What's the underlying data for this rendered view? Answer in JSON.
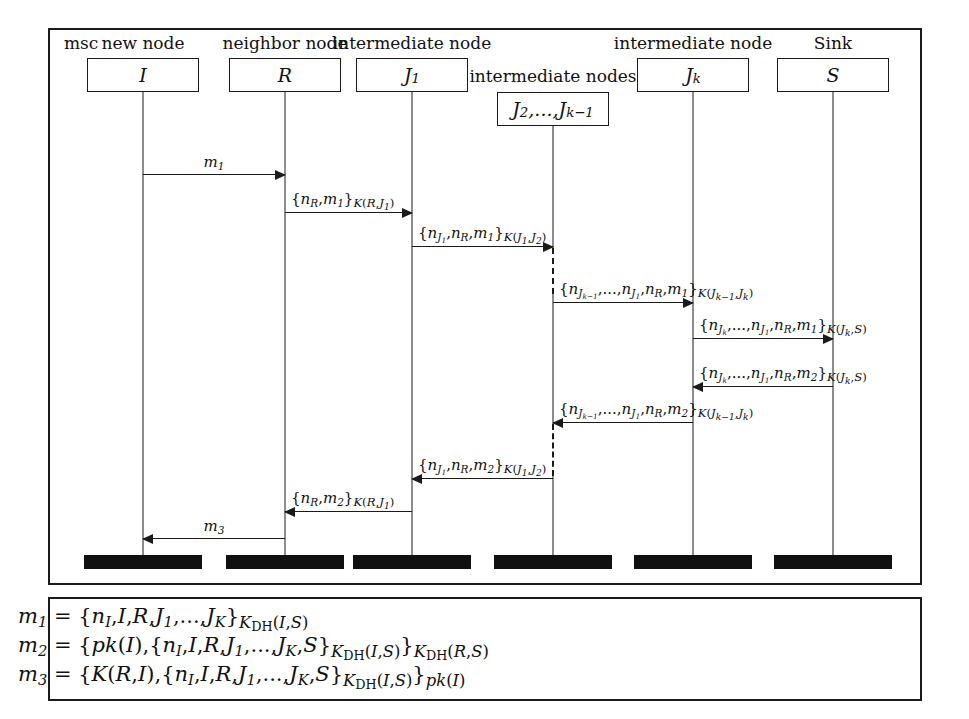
{
  "diagram": {
    "type": "message-sequence-chart",
    "keyword": "msc",
    "frame_label": "msc"
  },
  "instances": [
    {
      "role": "new node",
      "name": "I",
      "name_html": "<span class=\"mi\">I</span>",
      "x": 143,
      "box_w": 112
    },
    {
      "role": "neighbor node",
      "name": "R",
      "name_html": "<span class=\"mi\">R</span>",
      "x": 285,
      "box_w": 112
    },
    {
      "role": "intermediate node",
      "name": "J1",
      "name_html": "<span class=\"mi\">J</span><sub>1</sub>",
      "x": 412,
      "box_w": 112
    },
    {
      "role": "intermediate nodes",
      "name": "J2,...,Jk-1",
      "name_html": "<span class=\"mi\">J</span><sub>2</sub>,...,<span class=\"mi\">J</span><sub>k&minus;1</sub>",
      "x": 553,
      "box_w": 112
    },
    {
      "role": "intermediate node",
      "name": "Jk",
      "name_html": "<span class=\"mi\">J</span><sub>k</sub>",
      "x": 693,
      "box_w": 112
    },
    {
      "role": "Sink",
      "name": "S",
      "name_html": "<span class=\"mi\">S</span>",
      "x": 833,
      "box_w": 112
    }
  ],
  "messages": [
    {
      "id": "msg-1",
      "from": "I",
      "to": "R",
      "direction": "right",
      "label_plain": "m1",
      "label_html": "<span class=\"mi\">m</span><sub>1</sub>",
      "label_pos": "center",
      "y": 174,
      "x1": 143,
      "x2": 285
    },
    {
      "id": "msg-2",
      "from": "R",
      "to": "J1",
      "direction": "right",
      "label_plain": "{nR,m1}K(R,J1)",
      "label_html": "{<span class=\"mi\">n</span><sub>R</sub>,<span class=\"mi\">m</span><sub>1</sub>}<span class=\"sub-script\"><span class=\"mi\">K</span>(<span class=\"mi\">R</span>,<span class=\"mi\">J</span><sub>1</sub>)</span>",
      "label_pos": "left",
      "y": 212,
      "x1": 285,
      "x2": 412
    },
    {
      "id": "msg-3",
      "from": "J1",
      "to": "J2..Jk-1",
      "direction": "right",
      "label_plain": "{nJ1,nR,m1}K(J1,J2)",
      "label_html": "{<span class=\"mi\">n</span><sub><span class=\"mi\">J</span><sub>1</sub></sub>,<span class=\"mi\">n</span><sub>R</sub>,<span class=\"mi\">m</span><sub>1</sub>}<span class=\"sub-script\"><span class=\"mi\">K</span>(<span class=\"mi\">J</span><sub>1</sub>,<span class=\"mi\">J</span><sub>2</sub>)</span>",
      "label_pos": "left",
      "y": 246,
      "x1": 412,
      "x2": 553
    },
    {
      "id": "msg-4",
      "from": "J2..Jk-1",
      "to": "Jk",
      "direction": "right",
      "label_plain": "{nJk-1,...,nJ1,nR,m1}K(Jk-1,Jk)",
      "label_html": "{<span class=\"mi\">n</span><sub><span class=\"mi\">J</span><sub>k&minus;1</sub></sub>,...,<span class=\"mi\">n</span><sub><span class=\"mi\">J</span><sub>1</sub></sub>,<span class=\"mi\">n</span><sub>R</sub>,<span class=\"mi\">m</span><sub>1</sub>}<span class=\"sub-script\"><span class=\"mi\">K</span>(<span class=\"mi\">J</span><sub>k&minus;1</sub>,<span class=\"mi\">J</span><sub>k</sub>)</span>",
      "label_pos": "left",
      "y": 302,
      "x1": 553,
      "x2": 693
    },
    {
      "id": "msg-5",
      "from": "Jk",
      "to": "S",
      "direction": "right",
      "label_plain": "{nJk,...,nJ1,nR,m1}K(Jk,S)",
      "label_html": "{<span class=\"mi\">n</span><sub><span class=\"mi\">J</span><sub>k</sub></sub>,...,<span class=\"mi\">n</span><sub><span class=\"mi\">J</span><sub>1</sub></sub>,<span class=\"mi\">n</span><sub>R</sub>,<span class=\"mi\">m</span><sub>1</sub>}<span class=\"sub-script\"><span class=\"mi\">K</span>(<span class=\"mi\">J</span><sub>k</sub>,<span class=\"mi\">S</span>)</span>",
      "label_pos": "left",
      "y": 338,
      "x1": 693,
      "x2": 833
    },
    {
      "id": "msg-6",
      "from": "S",
      "to": "Jk",
      "direction": "left",
      "label_plain": "{nJk,...,nJ1,nR,m2}K(Jk,S)",
      "label_html": "{<span class=\"mi\">n</span><sub><span class=\"mi\">J</span><sub>k</sub></sub>,...,<span class=\"mi\">n</span><sub><span class=\"mi\">J</span><sub>1</sub></sub>,<span class=\"mi\">n</span><sub>R</sub>,<span class=\"mi\">m</span><sub>2</sub>}<span class=\"sub-script\"><span class=\"mi\">K</span>(<span class=\"mi\">J</span><sub>k</sub>,<span class=\"mi\">S</span>)</span>",
      "label_pos": "left",
      "y": 386,
      "x1": 693,
      "x2": 833
    },
    {
      "id": "msg-7",
      "from": "Jk",
      "to": "J2..Jk-1",
      "direction": "left",
      "label_plain": "{nJk-1,...,nJ1,nR,m2}K(Jk-1,Jk)",
      "label_html": "{<span class=\"mi\">n</span><sub><span class=\"mi\">J</span><sub>k&minus;1</sub></sub>,...,<span class=\"mi\">n</span><sub><span class=\"mi\">J</span><sub>1</sub></sub>,<span class=\"mi\">n</span><sub>R</sub>,<span class=\"mi\">m</span><sub>2</sub>}<span class=\"sub-script\"><span class=\"mi\">K</span>(<span class=\"mi\">J</span><sub>k&minus;1</sub>,<span class=\"mi\">J</span><sub>k</sub>)</span>",
      "label_pos": "left",
      "y": 422,
      "x1": 553,
      "x2": 693
    },
    {
      "id": "msg-8",
      "from": "J2..Jk-1",
      "to": "J1",
      "direction": "left",
      "label_plain": "{nJ1,nR,m2}K(J1,J2)",
      "label_html": "{<span class=\"mi\">n</span><sub><span class=\"mi\">J</span><sub>1</sub></sub>,<span class=\"mi\">n</span><sub>R</sub>,<span class=\"mi\">m</span><sub>2</sub>}<span class=\"sub-script\"><span class=\"mi\">K</span>(<span class=\"mi\">J</span><sub>1</sub>,<span class=\"mi\">J</span><sub>2</sub>)</span>",
      "label_pos": "left",
      "y": 478,
      "x1": 412,
      "x2": 553
    },
    {
      "id": "msg-9",
      "from": "J1",
      "to": "R",
      "direction": "left",
      "label_plain": "{nR,m2}K(R,J1)",
      "label_html": "{<span class=\"mi\">n</span><sub>R</sub>,<span class=\"mi\">m</span><sub>2</sub>}<span class=\"sub-script\"><span class=\"mi\">K</span>(<span class=\"mi\">R</span>,<span class=\"mi\">J</span><sub>1</sub>)</span>",
      "label_pos": "left",
      "y": 511,
      "x1": 285,
      "x2": 412
    },
    {
      "id": "msg-10",
      "from": "R",
      "to": "I",
      "direction": "left",
      "label_plain": "m3",
      "label_html": "<span class=\"mi\">m</span><sub>3</sub>",
      "label_pos": "center",
      "y": 538,
      "x1": 143,
      "x2": 285
    }
  ],
  "legend": [
    {
      "id": "def-m1",
      "plain": "m1 = {nI,I,R,J1,...,JK}KDH(I,S)",
      "html": "<span class=\"mi\">m</span><sub>1</sub> = {<span class=\"mi\">n</span><sub>I</sub>,<span class=\"mi\">I</span>,<span class=\"mi\">R</span>,<span class=\"mi\">J</span><sub>1</sub>,...,<span class=\"mi\">J</span><sub>K</sub>}<span class=\"sub-script\"><span class=\"mi\">K</span><sub><span class=\"mup\">DH</span></sub>(<span class=\"mi\">I</span>,<span class=\"mi\">S</span>)</span>"
    },
    {
      "id": "def-m2",
      "plain": "m2 = {pk(I),{nI,I,R,J1,...,JK,S}KDH(I,S)}KDH(R,S)",
      "html": "<span class=\"mi\">m</span><sub>2</sub> = {<span class=\"mi\">pk</span>(<span class=\"mi\">I</span>),{<span class=\"mi\">n</span><sub>I</sub>,<span class=\"mi\">I</span>,<span class=\"mi\">R</span>,<span class=\"mi\">J</span><sub>1</sub>,...,<span class=\"mi\">J</span><sub>K</sub>,<span class=\"mi\">S</span>}<span class=\"sub-script\"><span class=\"mi\">K</span><sub><span class=\"mup\">DH</span></sub>(<span class=\"mi\">I</span>,<span class=\"mi\">S</span>)</span>}<span class=\"sub-script\"><span class=\"mi\">K</span><sub><span class=\"mup\">DH</span></sub>(<span class=\"mi\">R</span>,<span class=\"mi\">S</span>)</span>"
    },
    {
      "id": "def-m3",
      "plain": "m3 = {K(R,I),{nI,I,R,J1,...,JK,S}KDH(I,S)}pk(I)",
      "html": "<span class=\"mi\">m</span><sub>3</sub> = {<span class=\"mi\">K</span>(<span class=\"mi\">R</span>,<span class=\"mi\">I</span>),{<span class=\"mi\">n</span><sub>I</sub>,<span class=\"mi\">I</span>,<span class=\"mi\">R</span>,<span class=\"mi\">J</span><sub>1</sub>,...,<span class=\"mi\">J</span><sub>K</sub>,<span class=\"mi\">S</span>}<span class=\"sub-script\"><span class=\"mi\">K</span><sub><span class=\"mup\">DH</span></sub>(<span class=\"mi\">I</span>,<span class=\"mi\">S</span>)</span>}<span class=\"sub-script\"><span class=\"mi\">pk</span>(<span class=\"mi\">I</span>)</span>"
    }
  ],
  "colors": {
    "line": "#1a1a1a",
    "background": "#ffffff",
    "termination_bar": "#101010"
  }
}
